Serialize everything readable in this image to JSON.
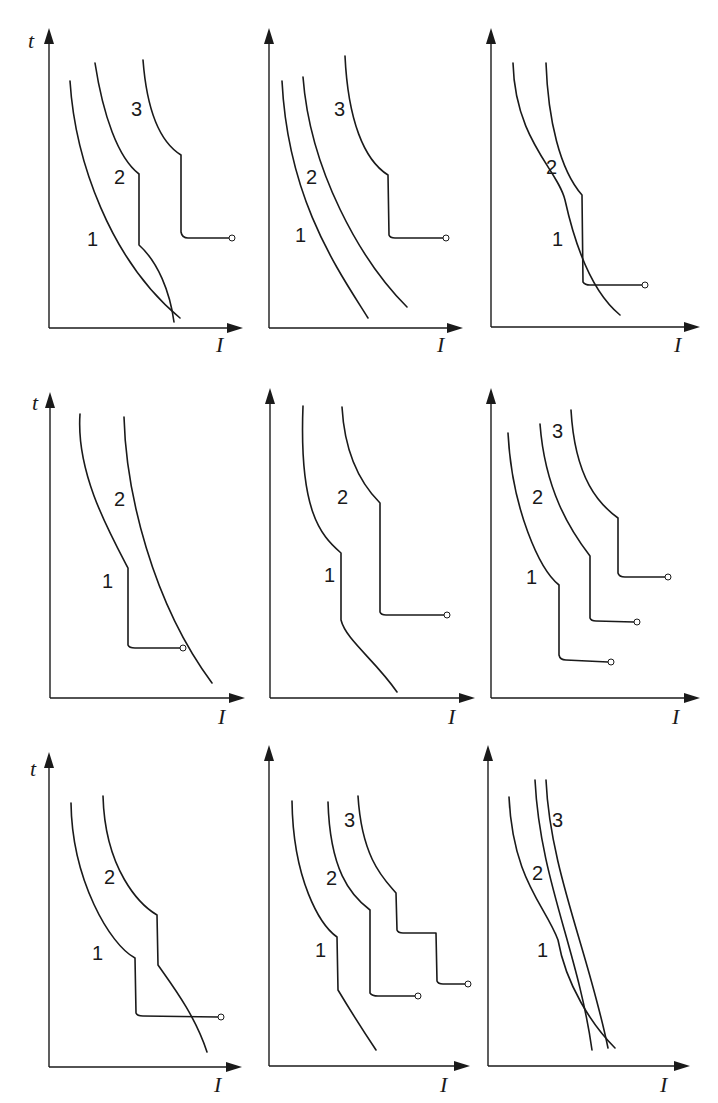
{
  "figure": {
    "rows": 3,
    "cols": 3,
    "axis_labels": {
      "y": "t",
      "x": "I"
    }
  },
  "panels": [
    {
      "id": "p1",
      "y_label": "t",
      "x_label": "I",
      "axes": {
        "ox": 49,
        "oy": 328,
        "top": 28,
        "right": 243,
        "tx": 28,
        "ty": 48,
        "ix": 216,
        "iy": 352
      },
      "curves": [
        {
          "label": "1",
          "lx": 87,
          "ly": 246,
          "d": "M70,81 C75,160 110,260 180,318"
        },
        {
          "label": "2",
          "lx": 114,
          "ly": 184,
          "d": "M95,63 C103,115 118,158 139,174 L139,245 C158,262 170,292 174,322"
        },
        {
          "label": "3",
          "lx": 131,
          "ly": 116,
          "d": "M143,60 C147,112 160,142 181,155 L181,232 Q182,238 188,238 L229,238"
        }
      ],
      "endpoints": [
        {
          "x": 232,
          "y": 238
        }
      ]
    },
    {
      "id": "p2",
      "y_label": "",
      "x_label": "I",
      "axes": {
        "ox": 269,
        "oy": 328,
        "top": 28,
        "right": 463,
        "tx": -100,
        "ty": -100,
        "ix": 437,
        "iy": 352
      },
      "curves": [
        {
          "label": "1",
          "lx": 295,
          "ly": 242,
          "d": "M282,81 C288,200 338,270 368,318"
        },
        {
          "label": "2",
          "lx": 306,
          "ly": 184,
          "d": "M303,77 C310,170 360,260 407,307"
        },
        {
          "label": "3",
          "lx": 334,
          "ly": 116,
          "d": "M345,56 C348,120 364,160 388,175 L389,235 Q390,238 395,238 L443,238"
        }
      ],
      "endpoints": [
        {
          "x": 446,
          "y": 238
        }
      ]
    },
    {
      "id": "p3",
      "y_label": "",
      "x_label": "I",
      "axes": {
        "ox": 491,
        "oy": 327,
        "top": 28,
        "right": 700,
        "tx": -100,
        "ty": -100,
        "ix": 674,
        "iy": 352
      },
      "curves": [
        {
          "label": "1",
          "lx": 552,
          "ly": 246,
          "d": "M513,63 C515,140 558,170 565,200 C575,245 592,292 620,315"
        },
        {
          "label": "2",
          "lx": 546,
          "ly": 174,
          "d": "M546,63 C548,120 560,170 582,195 L583,282 Q585,285 590,285 L642,285"
        }
      ],
      "endpoints": [
        {
          "x": 645,
          "y": 285
        }
      ]
    },
    {
      "id": "p4",
      "y_label": "t",
      "x_label": "I",
      "axes": {
        "ox": 50,
        "oy": 698,
        "top": 392,
        "right": 245,
        "tx": 32,
        "ty": 410,
        "ix": 218,
        "iy": 724
      },
      "curves": [
        {
          "label": "1",
          "lx": 102,
          "ly": 588,
          "d": "M80,414 C76,472 108,530 128,568 L128,645 Q129,648 135,648 L181,648"
        },
        {
          "label": "2",
          "lx": 114,
          "ly": 506,
          "d": "M124,417 C126,492 152,602 212,683"
        }
      ],
      "endpoints": [
        {
          "x": 183,
          "y": 648
        }
      ]
    },
    {
      "id": "p5",
      "y_label": "",
      "x_label": "I",
      "axes": {
        "ox": 270,
        "oy": 698,
        "top": 388,
        "right": 475,
        "tx": -100,
        "ty": -100,
        "ix": 448,
        "iy": 724
      },
      "curves": [
        {
          "label": "1",
          "lx": 324,
          "ly": 582,
          "d": "M303,406 C299,510 320,535 341,553 L341,620 C346,640 375,660 397,692"
        },
        {
          "label": "2",
          "lx": 337,
          "ly": 504,
          "d": "M342,407 C345,460 364,487 380,503 L380,612 Q381,615 386,615 L444,615"
        }
      ],
      "endpoints": [
        {
          "x": 447,
          "y": 615
        }
      ]
    },
    {
      "id": "p6",
      "y_label": "",
      "x_label": "I",
      "axes": {
        "ox": 491,
        "oy": 698,
        "top": 388,
        "right": 700,
        "tx": -100,
        "ty": -100,
        "ix": 672,
        "iy": 724
      },
      "curves": [
        {
          "label": "1",
          "lx": 526,
          "ly": 584,
          "d": "M508,433 C512,510 540,570 559,585 L559,655 Q560,660 566,660 L608,662"
        },
        {
          "label": "2",
          "lx": 532,
          "ly": 504,
          "d": "M540,424 C545,490 570,530 590,556 L590,618 Q591,621 596,621 L634,622"
        },
        {
          "label": "3",
          "lx": 552,
          "ly": 438,
          "d": "M571,410 C575,480 600,505 618,518 L618,573 Q619,577 625,577 L665,577"
        }
      ],
      "endpoints": [
        {
          "x": 611,
          "y": 662
        },
        {
          "x": 637,
          "y": 622
        },
        {
          "x": 668,
          "y": 577
        }
      ]
    },
    {
      "id": "p7",
      "y_label": "t",
      "x_label": "I",
      "axes": {
        "ox": 49,
        "oy": 1067,
        "top": 752,
        "right": 242,
        "tx": 30,
        "ty": 776,
        "ix": 214,
        "iy": 1092
      },
      "curves": [
        {
          "label": "1",
          "lx": 92,
          "ly": 960,
          "d": "M71,803 C72,880 110,945 135,958 L136,1013 Q137,1016 143,1016 L218,1017"
        },
        {
          "label": "2",
          "lx": 104,
          "ly": 884,
          "d": "M103,796 C105,870 140,905 157,915 L158,965 C172,985 195,1015 207,1052"
        }
      ],
      "endpoints": [
        {
          "x": 221,
          "y": 1017
        }
      ]
    },
    {
      "id": "p8",
      "y_label": "",
      "x_label": "I",
      "axes": {
        "ox": 269,
        "oy": 1066,
        "top": 745,
        "right": 470,
        "tx": -100,
        "ty": -100,
        "ix": 440,
        "iy": 1092
      },
      "curves": [
        {
          "label": "1",
          "lx": 315,
          "ly": 957,
          "d": "M292,801 C293,880 320,925 337,937 L338,990 C350,1010 366,1035 376,1050"
        },
        {
          "label": "2",
          "lx": 326,
          "ly": 885,
          "d": "M328,802 C330,870 350,895 370,910 L370,993 Q372,996 378,996 L415,996"
        },
        {
          "label": "3",
          "lx": 344,
          "ly": 827,
          "d": "M358,796 C362,860 385,880 396,893 L397,930 Q398,933 403,933 L436,933 L437,981 Q438,984 443,984 L465,984"
        }
      ],
      "endpoints": [
        {
          "x": 418,
          "y": 996
        },
        {
          "x": 468,
          "y": 984
        }
      ]
    },
    {
      "id": "p9",
      "y_label": "",
      "x_label": "I",
      "axes": {
        "ox": 488,
        "oy": 1066,
        "top": 745,
        "right": 690,
        "tx": -100,
        "ty": -100,
        "ix": 660,
        "iy": 1092
      },
      "curves": [
        {
          "label": "1",
          "lx": 537,
          "ly": 957,
          "d": "M509,797 C513,880 545,905 558,940 C566,985 592,1025 615,1048"
        },
        {
          "label": "2",
          "lx": 532,
          "ly": 880,
          "d": "M535,780 C540,880 578,950 592,1050"
        },
        {
          "label": "3",
          "lx": 552,
          "ly": 827,
          "d": "M546,780 C550,870 588,950 608,1048"
        }
      ],
      "endpoints": []
    }
  ]
}
